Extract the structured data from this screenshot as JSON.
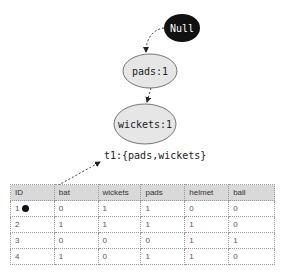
{
  "header": {
    "clipped_text": ""
  },
  "diagram": {
    "nodes": [
      {
        "id": "null",
        "label": "Null",
        "fill": "#111111",
        "text_color": "#ffffff"
      },
      {
        "id": "pads",
        "label": "pads:1",
        "fill": "#e6e6e6",
        "text_color": "#222222"
      },
      {
        "id": "wickets",
        "label": "wickets:1",
        "fill": "#e6e6e6",
        "text_color": "#222222"
      }
    ],
    "edges": [
      {
        "from": "null",
        "to": "pads",
        "style": "dashed"
      },
      {
        "from": "pads",
        "to": "wickets",
        "style": "dashed"
      },
      {
        "from": "row-1",
        "to": "t1-label",
        "style": "dashed"
      }
    ],
    "transaction_label": "t1:{pads,wickets}"
  },
  "table": {
    "columns": [
      "ID",
      "bat",
      "wickets",
      "pads",
      "helmet",
      "ball"
    ],
    "rows": [
      [
        "1",
        "0",
        "1",
        "1",
        "0",
        "0"
      ],
      [
        "2",
        "1",
        "1",
        "1",
        "1",
        "0"
      ],
      [
        "3",
        "0",
        "0",
        "0",
        "1",
        "1"
      ],
      [
        "4",
        "1",
        "0",
        "1",
        "1",
        "0"
      ]
    ],
    "header_bg": "#d9d9d9"
  }
}
